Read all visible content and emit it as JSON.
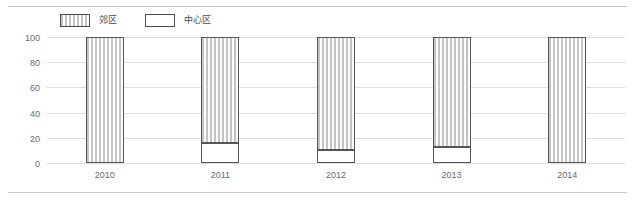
{
  "chart_data": {
    "type": "bar",
    "subtype": "stacked-percentage-column",
    "title": "",
    "xlabel": "",
    "ylabel": "",
    "categories": [
      "2010",
      "2011",
      "2012",
      "2013",
      "2014"
    ],
    "series": [
      {
        "name": "郊区",
        "values": [
          100,
          84,
          90,
          87,
          100
        ]
      },
      {
        "name": "中心区",
        "values": [
          0,
          16,
          10,
          13,
          0
        ]
      }
    ],
    "stack_order_bottom_to_top": [
      "中心区",
      "郊区"
    ],
    "ylim": [
      0,
      100
    ],
    "yticks": [
      0,
      20,
      40,
      60,
      80,
      100
    ],
    "ytick_labels": [
      "0",
      "20",
      "40",
      "60",
      "80",
      "100"
    ],
    "grid": true,
    "grid_axis": "y",
    "legend_position": "top-left"
  },
  "legend": {
    "items": [
      {
        "label": "郊区",
        "swatch": "hatched-vertical-stripes",
        "color": "#c4c4c4"
      },
      {
        "label": "中心区",
        "swatch": "white-fill",
        "color": "#ffffff"
      }
    ]
  },
  "axes": {
    "y": {
      "ticks": [
        "100",
        "80",
        "60",
        "40",
        "20",
        "0"
      ]
    },
    "x": {
      "ticks": [
        "2010",
        "2011",
        "2012",
        "2013",
        "2014"
      ]
    }
  },
  "colors": {
    "hatch_stripe": "#c4c4c4",
    "bar_outline": "#555555",
    "gridline": "#dedede",
    "rule": "#c9c9c9",
    "tick_text": "#6b6b6b",
    "legend_text": "#4a4a4a",
    "background": "#ffffff"
  }
}
